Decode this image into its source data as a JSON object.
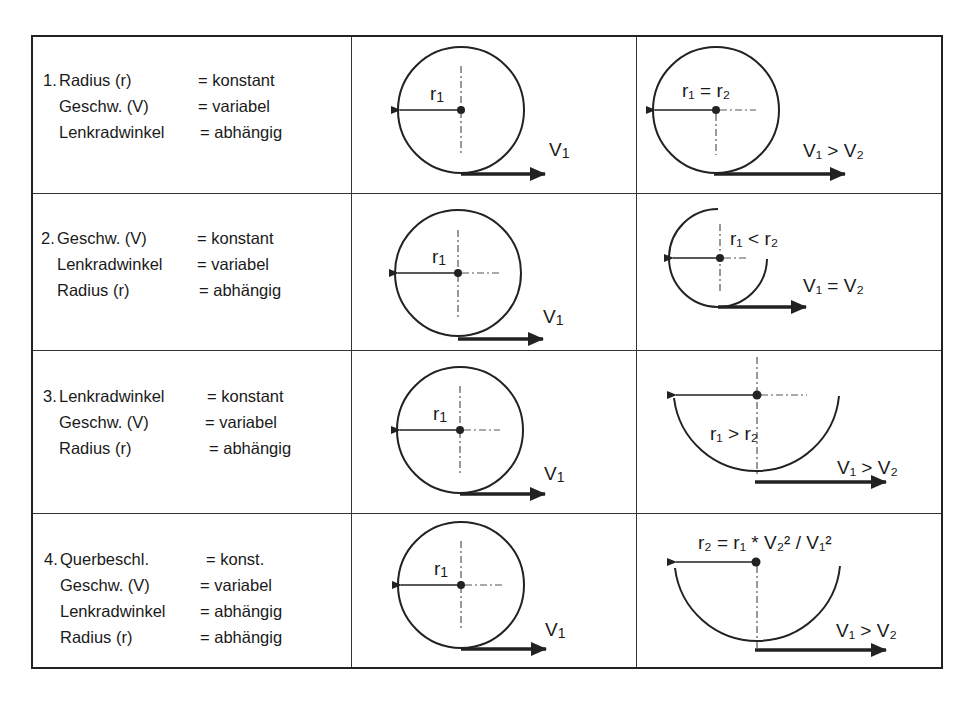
{
  "rows": [
    {
      "number": "1.",
      "lines": [
        {
          "key": "Radius (r)",
          "value": "= konstant"
        },
        {
          "key": "Geschw. (V)",
          "value": "= variabel"
        },
        {
          "key": "Lenkradwinkel",
          "value": "= abhängig"
        }
      ],
      "case1": {
        "r_label": "r",
        "r_sub": "1",
        "v_label": "V",
        "v_sub": "1"
      },
      "case2": {
        "relation": "r₁ = r₂",
        "v_relation": "V₁ > V₂"
      }
    },
    {
      "number": "2.",
      "lines": [
        {
          "key": "Geschw. (V)",
          "value": "= konstant"
        },
        {
          "key": "Lenkradwinkel",
          "value": "= variabel"
        },
        {
          "key": "Radius (r)",
          "value": "= abhängig"
        }
      ],
      "case1": {
        "r_label": "r",
        "r_sub": "1",
        "v_label": "V",
        "v_sub": "1"
      },
      "case2": {
        "relation": "r₁ < r₂",
        "v_relation": "V₁ = V₂"
      }
    },
    {
      "number": "3.",
      "lines": [
        {
          "key": "Lenkradwinkel",
          "value": "= konstant"
        },
        {
          "key": "Geschw. (V)",
          "value": "= variabel"
        },
        {
          "key": "Radius (r)",
          "value": "= abhängig"
        }
      ],
      "case1": {
        "r_label": "r",
        "r_sub": "1",
        "v_label": "V",
        "v_sub": "1"
      },
      "case2": {
        "relation": "r₁ > r₂",
        "v_relation": "V₁ > V₂"
      }
    },
    {
      "number": "4.",
      "lines": [
        {
          "key": "Querbeschl.",
          "value": "= konst."
        },
        {
          "key": "Geschw. (V)",
          "value": "= variabel"
        },
        {
          "key": "Lenkradwinkel",
          "value": "= abhängig"
        },
        {
          "key": "Radius (r)",
          "value": "= abhängig"
        }
      ],
      "case1": {
        "r_label": "r",
        "r_sub": "1",
        "v_label": "V",
        "v_sub": "1"
      },
      "case2": {
        "relation": "r₂ = r₁ * V₂² / V₁²",
        "v_relation": "V₁ > V₂"
      }
    }
  ],
  "colors": {
    "line": "#222222",
    "text": "#1a1a1a",
    "background": "#ffffff"
  }
}
